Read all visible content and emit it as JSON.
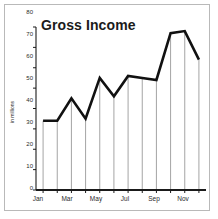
{
  "chart_data": {
    "type": "line",
    "title": "Gross Income",
    "xlabel": "",
    "ylabel": "in millions",
    "categories": [
      "Jan",
      "Feb",
      "Mar",
      "Apr",
      "May",
      "Jun",
      "Jul",
      "Aug",
      "Sep",
      "Oct",
      "Nov",
      "Dec"
    ],
    "values": [
      34,
      34,
      45,
      35,
      55,
      46,
      56,
      55,
      54,
      77,
      78,
      64
    ],
    "series": [
      {
        "name": "Gross Income",
        "values": [
          34,
          34,
          45,
          35,
          55,
          46,
          56,
          55,
          54,
          77,
          78,
          64
        ]
      }
    ],
    "ylim": [
      0,
      80
    ],
    "y_ticks": [
      0,
      10,
      20,
      30,
      40,
      50,
      60,
      70,
      80
    ],
    "y_tick_labels": [
      "0",
      "10",
      "20",
      "30",
      "40",
      "50",
      "60",
      "70",
      "80"
    ],
    "x_tick_labels": [
      "Jan",
      "Mar",
      "May",
      "Jul",
      "Sep",
      "Nov"
    ],
    "x_tick_indices": [
      0,
      2,
      4,
      6,
      8,
      10
    ],
    "grid": false,
    "drop_lines": true,
    "legend": "none",
    "line_color": "#111111",
    "axis_color": "#1a1a1a",
    "drop_line_color": "#9a9a9a",
    "background_color": "#ffffff",
    "frame_color": "#b9b9b9"
  }
}
